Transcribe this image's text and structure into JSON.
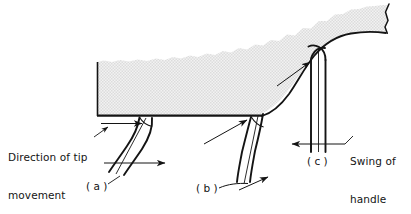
{
  "figure": {
    "background_color": "#ffffff",
    "ink_color": "#141414",
    "shade_color": "#e8e8e8",
    "shade_pattern": "stipple-halftone"
  },
  "labels": {
    "direction_of_tip_movement": "Direction of tip\nmovement",
    "direction_line1": "Direction of tip",
    "direction_line2": "movement",
    "swing_of_handle": "Swing of\nhandle",
    "swing_line1": "Swing of",
    "swing_line2": "handle",
    "position_a": "( a )",
    "position_b": "( b )",
    "position_c": "( c )"
  },
  "annotations": [
    {
      "name": "tip-movement-arrow",
      "kind": "arrow",
      "text": "Direction of tip movement",
      "points_to": "tool tip at lower-left edge of workpiece",
      "direction": "right"
    },
    {
      "name": "handle-swing-arrow",
      "kind": "arrow",
      "text": "Swing of handle",
      "points_to": "handle in position (c)",
      "direction": "left"
    },
    {
      "name": "position-a-leader",
      "kind": "leader",
      "text": "( a )",
      "points_to": "handle in first (trailing) position"
    },
    {
      "name": "position-b-leader",
      "kind": "leader",
      "text": "( b )",
      "points_to": "handle in intermediate position"
    },
    {
      "name": "position-c-leader",
      "kind": "leader",
      "text": "( c )",
      "points_to": "handle in final (upright) position"
    }
  ],
  "elements": {
    "workpiece": "stippled block with irregular torn top edge and curved right shoulder",
    "handle_positions": [
      "a",
      "b",
      "c"
    ],
    "handle_count": 3
  }
}
